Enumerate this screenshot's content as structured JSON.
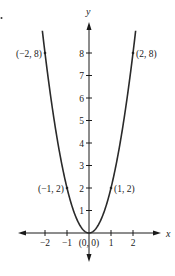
{
  "chart_data": {
    "type": "line",
    "title": "",
    "xlabel": "x",
    "ylabel": "y",
    "function": "y = 2x^2",
    "xlim": [
      -2.3,
      2.3
    ],
    "ylim": [
      0,
      8.6
    ],
    "x_ticks": [
      -2,
      -1,
      1,
      2
    ],
    "x_tick_labels": [
      "−2",
      "−1",
      "1",
      "2"
    ],
    "y_ticks": [
      1,
      2,
      3,
      4,
      5,
      6,
      7,
      8
    ],
    "y_tick_labels": [
      "1",
      "2",
      "3",
      "4",
      "5",
      "6",
      "7",
      "8"
    ],
    "grid": false,
    "legend": null,
    "series": [
      {
        "name": "y = 2x^2",
        "x": [
          -2.1,
          -2,
          -1.5,
          -1,
          -0.5,
          0,
          0.5,
          1,
          1.5,
          2,
          2.1
        ],
        "y": [
          8.82,
          8,
          4.5,
          2,
          0.5,
          0,
          0.5,
          2,
          4.5,
          8,
          8.82
        ]
      }
    ],
    "annotations": [
      {
        "x": -2,
        "y": 8,
        "text": "(−2, 8)"
      },
      {
        "x": 2,
        "y": 8,
        "text": "(2, 8)"
      },
      {
        "x": -1,
        "y": 2,
        "text": "(−1, 2)"
      },
      {
        "x": 1,
        "y": 2,
        "text": "(1, 2)"
      },
      {
        "x": 0,
        "y": 0,
        "text": "(0, 0)"
      }
    ]
  },
  "colors": {
    "curve": "#2a2a2a",
    "axis": "#1a1a1a"
  }
}
